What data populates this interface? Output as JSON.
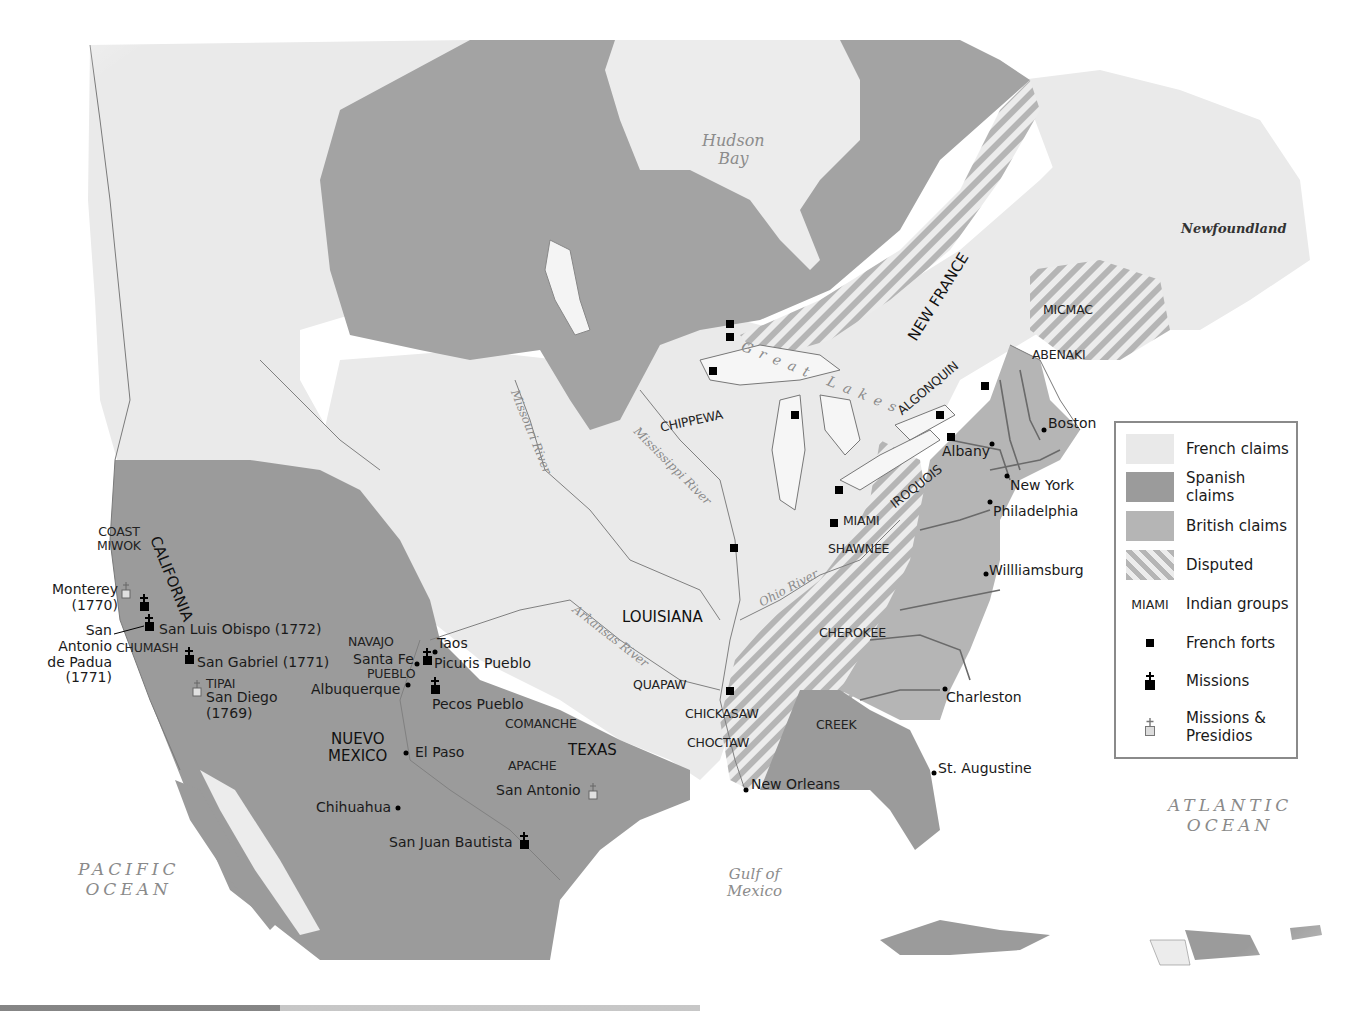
{
  "map": {
    "colors": {
      "french": "#e9e9e9",
      "spanish": "#9b9b9b",
      "british": "#b5b5b5",
      "disputed_a": "#b5b5b5",
      "disputed_b": "#ececec",
      "water": "#ffffff",
      "border": "#707070"
    },
    "water_bodies": {
      "hudson_bay": [
        "Hudson",
        "Bay"
      ],
      "newfoundland": "Newfoundland",
      "pacific": [
        "PACIFIC",
        "OCEAN"
      ],
      "atlantic": [
        "ATLANTIC",
        "OCEAN"
      ],
      "gulf": [
        "Gulf of",
        "Mexico"
      ],
      "great_lakes": "Great Lakes"
    },
    "rivers": {
      "missouri": "Missouri River",
      "mississippi": "Mississippi River",
      "ohio": "Ohio River",
      "arkansas": "Arkansas River"
    },
    "regions": {
      "new_france": "NEW FRANCE",
      "louisiana": "LOUISIANA",
      "california": "CALIFORNIA",
      "nuevo_mexico": [
        "NUEVO",
        "MEXICO"
      ],
      "texas": "TEXAS"
    },
    "indian_groups": {
      "coast_miwok": [
        "COAST",
        "MIWOK"
      ],
      "chumash": "CHUMASH",
      "tipai": "TIPAI",
      "navajo": "NAVAJO",
      "pueblo": "PUEBLO",
      "comanche": "COMANCHE",
      "apache": "APACHE",
      "quapaw": "QUAPAW",
      "chickasaw": "CHICKASAW",
      "choctaw": "CHOCTAW",
      "creek": "CREEK",
      "cherokee": "CHEROKEE",
      "shawnee": "SHAWNEE",
      "miami": "MIAMI",
      "chippewa": "CHIPPEWA",
      "iroquois": "IROQUOIS",
      "algonquin": "ALGONQUIN",
      "abenaki": "ABENAKI",
      "micmac": "MICMAC"
    },
    "places": {
      "monterey": [
        "Monterey",
        "(1770)"
      ],
      "san_antonio_padua": [
        "San",
        "Antonio",
        "de Padua",
        "(1771)"
      ],
      "san_luis_obispo": "San Luis Obispo (1772)",
      "san_gabriel": "San Gabriel (1771)",
      "san_diego": [
        "San Diego",
        "(1769)"
      ],
      "taos": "Taos",
      "santa_fe": "Santa Fe",
      "picuris": "Picuris Pueblo",
      "albuquerque": "Albuquerque",
      "pecos": "Pecos Pueblo",
      "el_paso": "El Paso",
      "chihuahua": "Chihuahua",
      "san_juan_bautista": "San Juan Bautista",
      "san_antonio": "San Antonio",
      "new_orleans": "New Orleans",
      "st_augustine": "St. Augustine",
      "charleston": "Charleston",
      "williamsburg": "Willliamsburg",
      "philadelphia": "Philadelphia",
      "new_york": "New York",
      "albany": "Albany",
      "boston": "Boston"
    }
  },
  "legend": {
    "items": [
      {
        "swatch": "french",
        "label": "French claims"
      },
      {
        "swatch": "spanish",
        "label": "Spanish claims"
      },
      {
        "swatch": "british",
        "label": "British claims"
      },
      {
        "swatch": "disputed",
        "label": "Disputed"
      },
      {
        "swatch": "text",
        "swatch_text": "MIAMI",
        "label": "Indian groups"
      },
      {
        "swatch": "fort-icon",
        "label": "French forts"
      },
      {
        "swatch": "mission-icon",
        "label": "Missions"
      },
      {
        "swatch": "mission-presidio-icon",
        "label": "Missions &",
        "label2": "Presidios"
      }
    ]
  }
}
